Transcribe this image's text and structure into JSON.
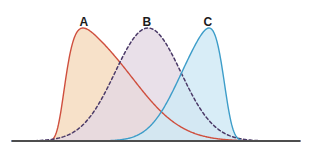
{
  "figure": {
    "background_color": "#ffffff",
    "width": 311,
    "height": 154,
    "axis_line_color": "#4d4d4d"
  },
  "labels": {
    "a": "A",
    "b": "B",
    "c": "C"
  },
  "chart_data": {
    "type": "area",
    "title": "",
    "subtitle": "",
    "xlabel": "",
    "ylabel": "",
    "grid": false,
    "legend": "inline-labels-above-peaks",
    "xlim": [
      0,
      311
    ],
    "ylim": [
      0,
      1
    ],
    "axis": {
      "baseline_y": 141,
      "x_start": 12,
      "x_end": 300,
      "color": "#4d4d4d",
      "width": 2,
      "ticks": [],
      "tick_labels": []
    },
    "series": [
      {
        "name": "A",
        "label": "A",
        "label_x": 84,
        "label_y": 16,
        "stroke": "#cf4f3e",
        "fill": "#f6dcc0",
        "fill_opacity": 0.85,
        "dash": "solid",
        "stroke_width": 1.4,
        "peak_x": 83,
        "peak_y": 28,
        "mean": 83,
        "sigma": 26,
        "skew": 0.85,
        "left_tail_x": 22,
        "right_tail_x": 292,
        "z_order": 1
      },
      {
        "name": "B",
        "label": "B",
        "label_x": 147,
        "label_y": 16,
        "stroke": "#4b3a68",
        "fill": "#e4d8e4",
        "fill_opacity": 0.8,
        "dash": "dashed",
        "dash_pattern": "3,2.6",
        "stroke_width": 1.5,
        "peak_x": 148,
        "peak_y": 28,
        "mean": 148,
        "sigma": 33,
        "skew": 0.0,
        "left_tail_x": 62,
        "right_tail_x": 233,
        "z_order": 2
      },
      {
        "name": "C",
        "label": "C",
        "label_x": 208,
        "label_y": 16,
        "stroke": "#3d9dc9",
        "fill": "#cfe9f5",
        "fill_opacity": 0.82,
        "dash": "solid",
        "stroke_width": 1.4,
        "peak_x": 209,
        "peak_y": 28,
        "mean": 209,
        "sigma": 19,
        "skew": -0.55,
        "left_tail_x": 26,
        "right_tail_x": 283,
        "z_order": 3
      }
    ]
  }
}
